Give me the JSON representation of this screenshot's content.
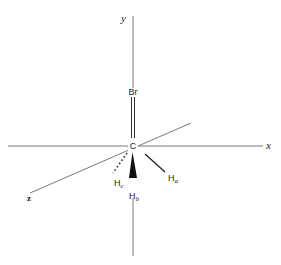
{
  "diagram": {
    "title": "",
    "axes": {
      "x_label": "x",
      "y_label": "y",
      "z_label": "z"
    },
    "atoms": {
      "center": "C",
      "top": "Br",
      "hb": "H",
      "hb_sub": "b",
      "hc": "H",
      "hc_sub": "c",
      "ha": "H",
      "ha_sub": "a"
    },
    "bonds": [
      {
        "from": "C",
        "to": "Br",
        "style": "plain-double-line"
      },
      {
        "from": "C",
        "to": "Hb",
        "style": "solid-wedge"
      },
      {
        "from": "C",
        "to": "Hc",
        "style": "dotted"
      },
      {
        "from": "C",
        "to": "Ha",
        "style": "plain"
      }
    ],
    "colors": {
      "axis": "#777777",
      "bond": "#222222",
      "text": "#222222"
    }
  }
}
